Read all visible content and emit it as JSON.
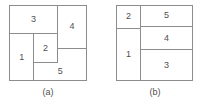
{
  "figure": {
    "background_color": "#ffffff",
    "line_color": "#8d8d8d",
    "text_color": "#4f4f4f",
    "type": "rectangle-packing-comparison",
    "panel_count": 2
  },
  "panels": [
    {
      "id": "a",
      "caption": "(a)",
      "outer_box": {
        "x": 9,
        "y": 5,
        "width": 78,
        "height": 76
      },
      "regions": [
        {
          "label": "3",
          "x_pct": 0,
          "y_pct": 0,
          "w_pct": 63,
          "h_pct": 38
        },
        {
          "label": "4",
          "x_pct": 63,
          "y_pct": 0,
          "w_pct": 37,
          "h_pct": 58
        },
        {
          "label": "1",
          "x_pct": 0,
          "y_pct": 38,
          "w_pct": 32,
          "h_pct": 62
        },
        {
          "label": "2",
          "x_pct": 32,
          "y_pct": 38,
          "w_pct": 31,
          "h_pct": 39
        },
        {
          "label": "5",
          "x_pct": 32,
          "y_pct": 77,
          "w_pct": 68,
          "h_pct": 23
        }
      ]
    },
    {
      "id": "b",
      "caption": "(b)",
      "outer_box": {
        "x": 116,
        "y": 5,
        "width": 77,
        "height": 76
      },
      "regions": [
        {
          "label": "2",
          "x_pct": 0,
          "y_pct": 0,
          "w_pct": 32,
          "h_pct": 31
        },
        {
          "label": "1",
          "x_pct": 0,
          "y_pct": 31,
          "w_pct": 32,
          "h_pct": 69
        },
        {
          "label": "5",
          "x_pct": 32,
          "y_pct": 0,
          "w_pct": 68,
          "h_pct": 28
        },
        {
          "label": "4",
          "x_pct": 32,
          "y_pct": 28,
          "w_pct": 68,
          "h_pct": 32
        },
        {
          "label": "3",
          "x_pct": 32,
          "y_pct": 60,
          "w_pct": 68,
          "h_pct": 40
        }
      ]
    }
  ]
}
